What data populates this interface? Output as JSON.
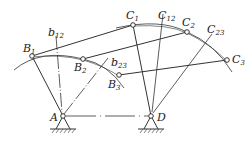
{
  "diagram": {
    "type": "four-bar-linkage-synthesis",
    "points": {
      "A": {
        "label": "A",
        "x": 63,
        "y": 116
      },
      "D": {
        "label": "D",
        "x": 151,
        "y": 116
      },
      "B1": {
        "label": "B",
        "sub": "1",
        "x": 32,
        "y": 56
      },
      "B2": {
        "label": "B",
        "sub": "2",
        "x": 83,
        "y": 59
      },
      "B3": {
        "label": "B",
        "sub": "3",
        "x": 119,
        "y": 75
      },
      "C1": {
        "label": "C",
        "sub": "1",
        "x": 133,
        "y": 25
      },
      "C2": {
        "label": "C",
        "sub": "2",
        "x": 187,
        "y": 32
      },
      "C3": {
        "label": "C",
        "sub": "3",
        "x": 227,
        "y": 60
      }
    },
    "labels": {
      "A": "A",
      "D": "D",
      "B1": {
        "main": "B",
        "sub": "1"
      },
      "B2": {
        "main": "B",
        "sub": "2"
      },
      "B3": {
        "main": "B",
        "sub": "3"
      },
      "C1": {
        "main": "C",
        "sub": "1"
      },
      "C2": {
        "main": "C",
        "sub": "2"
      },
      "C3": {
        "main": "C",
        "sub": "3"
      },
      "b12": {
        "main": "b",
        "sub": "12"
      },
      "b23": {
        "main": "b",
        "sub": "23"
      },
      "C12": {
        "main": "C",
        "sub": "12"
      },
      "C23": {
        "main": "C",
        "sub": "23"
      }
    },
    "colors": {
      "line": "#333333",
      "background": "#ffffff"
    }
  }
}
